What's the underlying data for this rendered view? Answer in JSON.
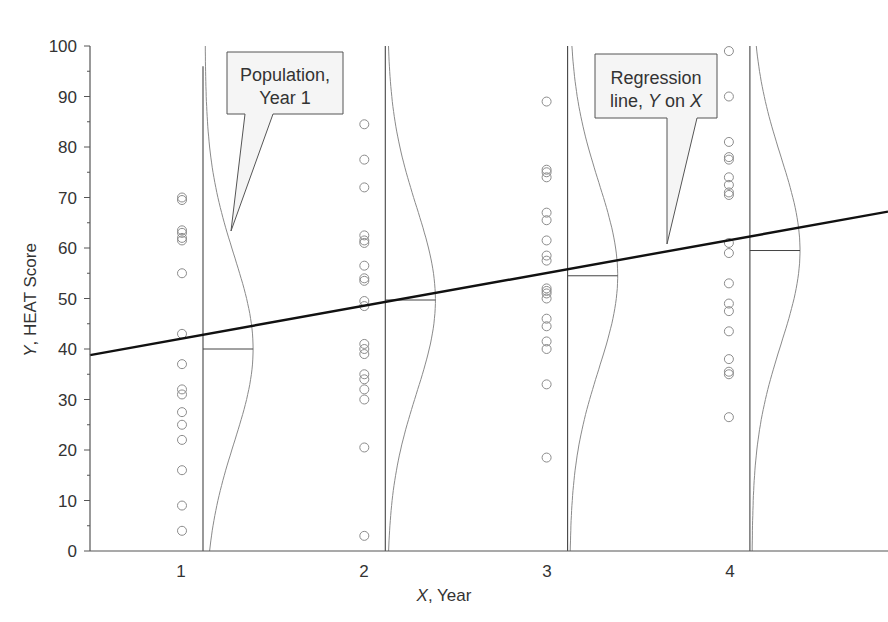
{
  "chart_data": {
    "type": "scatter",
    "title": "",
    "xlabel_italic": "X",
    "xlabel_rest": ", Year",
    "ylabel_italic": "Y",
    "ylabel_rest": ", HEAT Score",
    "xlim": [
      0.5,
      4.7
    ],
    "ylim": [
      0,
      100
    ],
    "x_ticks": [
      "1",
      "2",
      "3",
      "4"
    ],
    "y_ticks": [
      "0",
      "10",
      "20",
      "30",
      "40",
      "50",
      "60",
      "70",
      "80",
      "90",
      "100"
    ],
    "grid": false,
    "series": [
      {
        "name": "Year 1",
        "x": 1,
        "values": [
          70,
          69.5,
          63.5,
          63,
          62,
          61.5,
          55,
          43,
          37,
          32,
          31,
          27.5,
          25,
          22,
          16,
          9,
          4
        ]
      },
      {
        "name": "Year 2",
        "x": 2,
        "values": [
          84.5,
          77.5,
          72,
          62.5,
          61.5,
          61,
          56.5,
          54,
          53.5,
          49.5,
          48.5,
          41,
          40,
          39,
          35,
          34,
          32,
          30,
          20.5,
          3
        ]
      },
      {
        "name": "Year 3",
        "x": 3,
        "values": [
          89,
          75.5,
          75,
          74,
          67,
          65.5,
          61.5,
          58.5,
          57.5,
          52,
          51.5,
          51,
          50,
          46,
          44.5,
          41.5,
          40,
          33,
          18.5
        ]
      },
      {
        "name": "Year 4",
        "x": 4,
        "values": [
          99,
          90,
          81,
          78,
          77.5,
          74,
          72.5,
          71,
          70.5,
          61,
          59,
          53,
          49,
          47.5,
          43.5,
          38,
          35.5,
          35,
          26.5
        ]
      }
    ],
    "population_means": [
      40,
      49.7,
      54.5,
      59.5
    ],
    "regression_line": {
      "x_start": 0.5,
      "y_start": 38.8,
      "x_end": 4.7,
      "y_end": 67.2
    },
    "annotations": [
      {
        "label_line1": "Population,",
        "label_line2": "Year 1"
      },
      {
        "label_line1": "Regression",
        "label_line2_prefix": "line, ",
        "label_line2_y": "Y",
        "label_line2_mid": " on ",
        "label_line2_x": "X"
      }
    ]
  }
}
